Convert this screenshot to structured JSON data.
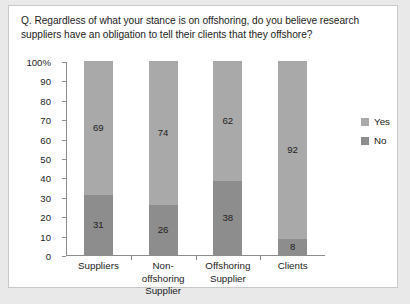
{
  "question": "Q. Regardless of what your stance is on offshoring, do you believe research suppliers have an obligation to tell their clients that they offshore?",
  "chart_data": {
    "type": "bar",
    "subtype": "stacked-100",
    "title": "Q. Regardless of what your stance is on offshoring, do you believe research suppliers have an obligation to tell their clients that they offshore?",
    "xlabel": "",
    "ylabel": "",
    "ylim": [
      0,
      100
    ],
    "yticks": [
      0,
      10,
      20,
      30,
      40,
      50,
      60,
      70,
      80,
      90,
      100
    ],
    "ytick_labels": [
      "0",
      "10",
      "20",
      "30",
      "40",
      "50",
      "60",
      "70",
      "80",
      "90",
      "100%"
    ],
    "grid": false,
    "legend_position": "right",
    "categories": [
      "Suppliers",
      "Non-offshoring Supplier",
      "Offshoring Supplier",
      "Clients"
    ],
    "category_lines": [
      [
        "Suppliers"
      ],
      [
        "Non-",
        "offshoring",
        "Supplier"
      ],
      [
        "Offshoring",
        "Supplier"
      ],
      [
        "Clients"
      ]
    ],
    "series": [
      {
        "name": "Yes",
        "color": "#a9a9a9",
        "values": [
          69,
          74,
          62,
          92
        ]
      },
      {
        "name": "No",
        "color": "#8d8d8d",
        "values": [
          31,
          26,
          38,
          8
        ]
      }
    ]
  },
  "legend": {
    "items": [
      {
        "label": "Yes",
        "color": "#a9a9a9"
      },
      {
        "label": "No",
        "color": "#8d8d8d"
      }
    ]
  }
}
